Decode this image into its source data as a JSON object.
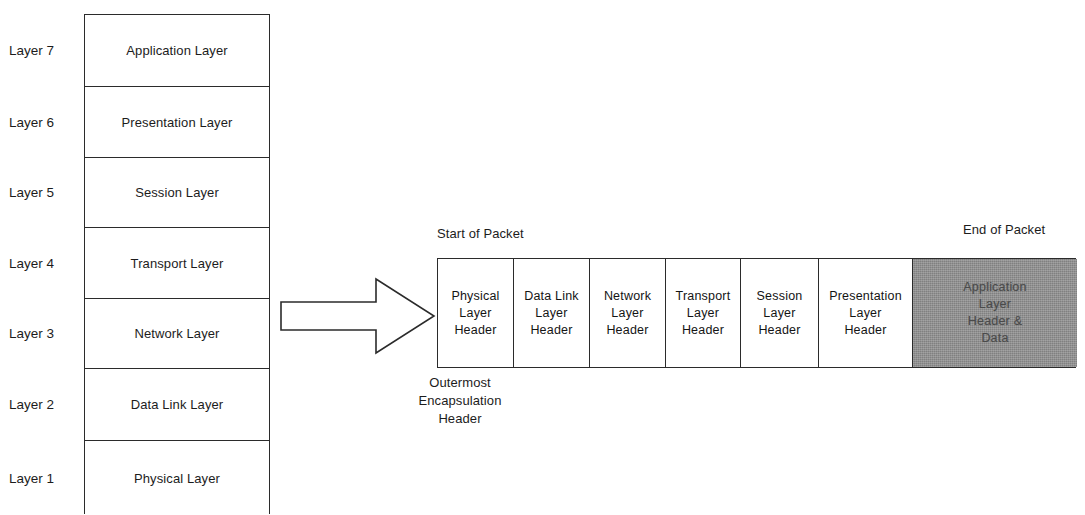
{
  "diagram": {
    "colors": {
      "line": "#2b2b2b",
      "text": "#1c1c1c",
      "shaded_fill": "#808080",
      "background": "#ffffff"
    }
  },
  "osi_stack": {
    "rows": [
      {
        "index_label": "Layer 7",
        "name": "Application Layer"
      },
      {
        "index_label": "Layer 6",
        "name": "Presentation Layer"
      },
      {
        "index_label": "Layer 5",
        "name": "Session Layer"
      },
      {
        "index_label": "Layer 4",
        "name": "Transport Layer"
      },
      {
        "index_label": "Layer 3",
        "name": "Network Layer"
      },
      {
        "index_label": "Layer 2",
        "name": "Data Link Layer"
      },
      {
        "index_label": "Layer 1",
        "name": "Physical Layer"
      }
    ]
  },
  "arrow": {
    "name": "encapsulation-flow-arrow",
    "direction": "right"
  },
  "packet": {
    "start_label": "Start of Packet",
    "end_label": "End of Packet",
    "outermost_label": {
      "line1": "Outermost",
      "line2": "Encapsulation",
      "line3": "Header"
    },
    "cells": [
      {
        "shaded": false,
        "width": 76,
        "line1": "Physical",
        "line2": "Layer",
        "line3": "Header",
        "line4": ""
      },
      {
        "shaded": false,
        "width": 76,
        "line1": "Data Link",
        "line2": "Layer",
        "line3": "Header",
        "line4": ""
      },
      {
        "shaded": false,
        "width": 76,
        "line1": "Network",
        "line2": "Layer",
        "line3": "Header",
        "line4": ""
      },
      {
        "shaded": false,
        "width": 75,
        "line1": "Transport",
        "line2": "Layer",
        "line3": "Header",
        "line4": ""
      },
      {
        "shaded": false,
        "width": 78,
        "line1": "Session",
        "line2": "Layer",
        "line3": "Header",
        "line4": ""
      },
      {
        "shaded": false,
        "width": 94,
        "line1": "Presentation",
        "line2": "Layer",
        "line3": "Header",
        "line4": ""
      },
      {
        "shaded": true,
        "width": 164,
        "line1": "Application",
        "line2": "Layer",
        "line3": "Header &",
        "line4": "Data"
      }
    ]
  }
}
